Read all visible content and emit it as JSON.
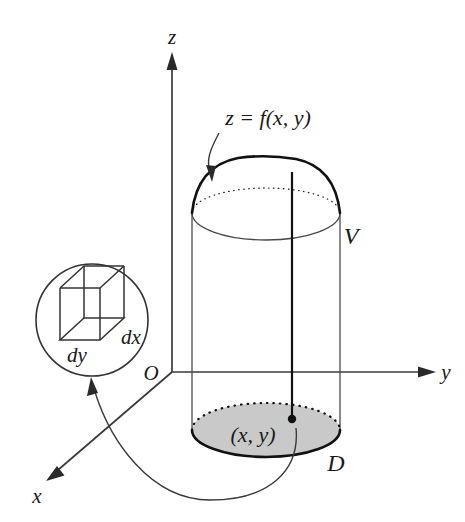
{
  "figure": {
    "axes": {
      "z_label": "z",
      "y_label": "y",
      "x_label": "x",
      "origin_label": "O"
    },
    "labels": {
      "surface": "z = f(x, y)",
      "solid": "V",
      "region": "D",
      "point": "(x, y)",
      "dx": "dx",
      "dy": "dy"
    },
    "colors": {
      "ink": "#111111",
      "axis": "#3a3a3a",
      "region_fill": "#c9c9c9",
      "background": "#ffffff",
      "box_fill": "#c9c9c9"
    },
    "geometry": {
      "origin_x": 172,
      "origin_y": 372,
      "cylinder_left": 192,
      "cylinder_right": 340,
      "base_center_y": 430,
      "top_rim_y": 213,
      "dome_apex_y": 157,
      "plumb_x": 292,
      "point_dot_y": 419,
      "magnifier_center_x": 92,
      "magnifier_center_y": 320,
      "magnifier_radius": 56
    }
  }
}
